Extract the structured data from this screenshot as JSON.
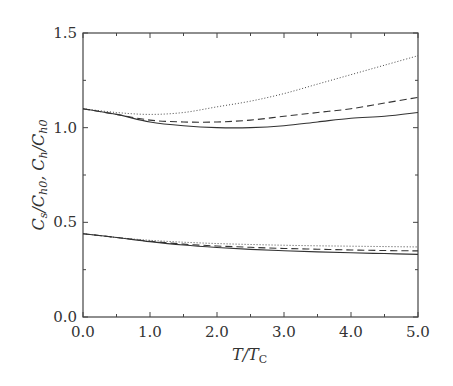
{
  "chart_data": {
    "type": "line",
    "title": "",
    "xlabel": "T/T_C",
    "ylabel": "C_s/C_h0, C_h/C_h0",
    "xlim": [
      0.0,
      5.0
    ],
    "ylim": [
      0.0,
      1.5
    ],
    "grid": false,
    "legend": null,
    "x_ticks": [
      "0.0",
      "1.0",
      "2.0",
      "3.0",
      "4.0",
      "5.0"
    ],
    "y_ticks": [
      "0.0",
      "0.5",
      "1.0",
      "1.5"
    ],
    "x": [
      0.0,
      0.5,
      1.0,
      1.5,
      2.0,
      2.5,
      3.0,
      3.5,
      4.0,
      4.5,
      5.0
    ],
    "series": [
      {
        "name": "C_h/C_h0 (dotted)",
        "style": "dotted",
        "group": "upper",
        "values": [
          1.1,
          1.08,
          1.07,
          1.08,
          1.11,
          1.14,
          1.18,
          1.23,
          1.28,
          1.33,
          1.38
        ]
      },
      {
        "name": "C_h/C_h0 (dashed)",
        "style": "dashed",
        "group": "upper",
        "values": [
          1.1,
          1.07,
          1.04,
          1.03,
          1.03,
          1.04,
          1.06,
          1.08,
          1.1,
          1.13,
          1.16
        ]
      },
      {
        "name": "C_h/C_h0 (solid)",
        "style": "solid",
        "group": "upper",
        "values": [
          1.1,
          1.07,
          1.03,
          1.01,
          1.0,
          1.0,
          1.01,
          1.03,
          1.05,
          1.06,
          1.08
        ]
      },
      {
        "name": "C_s/C_h0 (dotted)",
        "style": "dotted",
        "group": "lower",
        "values": [
          0.44,
          0.42,
          0.405,
          0.395,
          0.388,
          0.383,
          0.379,
          0.376,
          0.374,
          0.372,
          0.37
        ]
      },
      {
        "name": "C_s/C_h0 (dashed)",
        "style": "dashed",
        "group": "lower",
        "values": [
          0.44,
          0.42,
          0.4,
          0.385,
          0.375,
          0.368,
          0.362,
          0.358,
          0.354,
          0.351,
          0.349
        ]
      },
      {
        "name": "C_s/C_h0 (solid)",
        "style": "solid",
        "group": "lower",
        "values": [
          0.44,
          0.42,
          0.398,
          0.38,
          0.367,
          0.357,
          0.35,
          0.344,
          0.339,
          0.335,
          0.331
        ]
      }
    ]
  },
  "axes": {
    "x_label_main": "T/T",
    "x_label_sub": "C",
    "y_label": "C_s/C_h0, C_h/C_h0"
  }
}
